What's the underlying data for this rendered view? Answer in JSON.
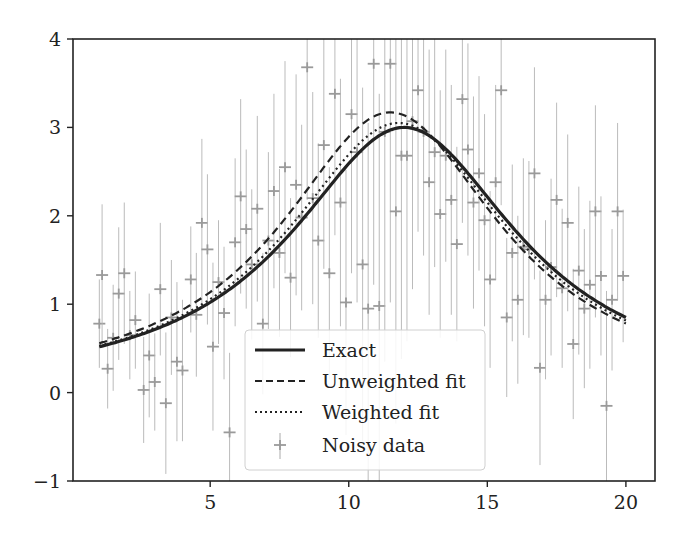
{
  "chart_data": {
    "type": "line",
    "title": "",
    "xlabel": "",
    "ylabel": "",
    "xlim": [
      0.05,
      21.05
    ],
    "ylim": [
      -1,
      4
    ],
    "grid": false,
    "legend_position": "lower center",
    "x_ticks": [
      5,
      10,
      15,
      20
    ],
    "x_tick_labels": [
      "5",
      "10",
      "15",
      "20"
    ],
    "y_ticks": [
      -1,
      0,
      1,
      2,
      3,
      4
    ],
    "y_tick_labels": [
      "−1",
      "0",
      "1",
      "2",
      "3",
      "4"
    ],
    "series": [
      {
        "name": "Exact",
        "style": "solid",
        "color": "#222222",
        "model": {
          "amplitude": 3.0,
          "center": 12.0,
          "width": 5.03
        },
        "x": [
          1,
          2,
          3,
          4,
          5,
          6,
          7,
          8,
          9,
          10,
          11,
          12,
          13,
          14,
          15,
          16,
          17,
          18,
          19,
          20
        ],
        "values": [
          0.52,
          0.62,
          0.74,
          0.9,
          1.1,
          1.38,
          1.73,
          2.13,
          2.56,
          2.88,
          2.99,
          3.0,
          2.88,
          2.59,
          2.23,
          1.84,
          1.5,
          1.24,
          1.02,
          0.85
        ]
      },
      {
        "name": "Unweighted fit",
        "style": "dashed",
        "color": "#222222",
        "model": {
          "amplitude": 3.17,
          "center": 11.5,
          "width": 4.86
        },
        "x": [
          1,
          2,
          3,
          4,
          5,
          6,
          7,
          8,
          9,
          10,
          11,
          12,
          13,
          14,
          15,
          16,
          17,
          18,
          19,
          20
        ],
        "values": [
          0.56,
          0.66,
          0.79,
          0.97,
          1.21,
          1.52,
          1.92,
          2.38,
          2.81,
          3.09,
          3.14,
          3.14,
          2.98,
          2.64,
          2.23,
          1.82,
          1.47,
          1.19,
          0.96,
          0.78
        ]
      },
      {
        "name": "Weighted fit",
        "style": "dotted",
        "color": "#222222",
        "model": {
          "amplitude": 3.05,
          "center": 11.8,
          "width": 4.95
        },
        "x": [
          1,
          2,
          3,
          4,
          5,
          6,
          7,
          8,
          9,
          10,
          11,
          12,
          13,
          14,
          15,
          16,
          17,
          18,
          19,
          20
        ],
        "values": [
          0.53,
          0.63,
          0.76,
          0.93,
          1.15,
          1.44,
          1.81,
          2.24,
          2.65,
          2.95,
          3.03,
          3.04,
          2.91,
          2.6,
          2.22,
          1.84,
          1.49,
          1.21,
          0.99,
          0.81
        ]
      },
      {
        "name": "Noisy data",
        "style": "errorbar-plus",
        "color": "#9a9a9a",
        "x": [
          1.0,
          1.1,
          1.3,
          1.5,
          1.7,
          1.9,
          2.1,
          2.3,
          2.6,
          2.8,
          3.0,
          3.2,
          3.4,
          3.6,
          3.8,
          4.0,
          4.3,
          4.5,
          4.7,
          4.9,
          5.1,
          5.3,
          5.5,
          5.7,
          5.9,
          6.1,
          6.3,
          6.5,
          6.7,
          6.9,
          7.1,
          7.3,
          7.5,
          7.7,
          7.9,
          8.1,
          8.3,
          8.5,
          8.7,
          8.9,
          9.1,
          9.3,
          9.5,
          9.7,
          9.9,
          10.1,
          10.3,
          10.5,
          10.7,
          10.9,
          11.1,
          11.3,
          11.5,
          11.7,
          11.9,
          12.1,
          12.3,
          12.5,
          12.7,
          12.9,
          13.1,
          13.3,
          13.5,
          13.7,
          13.9,
          14.1,
          14.3,
          14.5,
          14.7,
          14.9,
          15.1,
          15.3,
          15.5,
          15.7,
          15.9,
          16.1,
          16.3,
          16.5,
          16.7,
          16.9,
          17.1,
          17.3,
          17.5,
          17.7,
          17.9,
          18.1,
          18.3,
          18.5,
          18.7,
          18.9,
          19.1,
          19.3,
          19.5,
          19.7,
          19.9
        ],
        "values": [
          0.78,
          1.33,
          0.27,
          0.62,
          1.12,
          1.35,
          0.65,
          0.82,
          0.03,
          0.42,
          0.12,
          1.17,
          -0.12,
          0.85,
          0.35,
          0.25,
          1.28,
          0.88,
          1.92,
          1.62,
          0.52,
          1.25,
          0.9,
          -0.45,
          1.7,
          2.22,
          1.85,
          1.45,
          2.08,
          0.78,
          1.72,
          2.28,
          1.58,
          2.55,
          1.3,
          2.35,
          1.98,
          3.68,
          2.2,
          1.72,
          2.8,
          1.35,
          3.38,
          2.15,
          1.02,
          3.15,
          2.72,
          1.45,
          0.95,
          3.72,
          0.98,
          2.95,
          3.72,
          2.05,
          2.68,
          2.68,
          3.07,
          3.42,
          2.95,
          2.38,
          2.72,
          2.02,
          2.68,
          2.18,
          1.68,
          3.32,
          2.75,
          2.15,
          2.48,
          1.95,
          1.28,
          2.38,
          3.42,
          0.85,
          1.58,
          1.05,
          1.65,
          1.62,
          2.48,
          0.28,
          1.05,
          1.42,
          2.18,
          1.18,
          1.92,
          0.55,
          1.38,
          0.95,
          1.22,
          2.05,
          1.32,
          -0.15,
          1.05,
          2.05,
          1.32
        ],
        "errors": [
          0.5,
          0.8,
          0.45,
          0.6,
          0.75,
          0.8,
          0.5,
          0.55,
          0.6,
          0.7,
          0.55,
          0.75,
          0.8,
          0.65,
          0.9,
          0.8,
          0.6,
          0.7,
          0.95,
          0.85,
          0.95,
          0.7,
          0.75,
          0.9,
          0.95,
          1.1,
          0.9,
          0.85,
          1.05,
          0.8,
          1.0,
          1.1,
          0.95,
          1.2,
          0.9,
          1.25,
          1.05,
          1.5,
          1.2,
          1.1,
          1.4,
          1.2,
          1.6,
          1.4,
          1.5,
          1.8,
          1.7,
          2.0,
          2.1,
          2.5,
          2.4,
          2.6,
          2.7,
          2.4,
          2.3,
          2.1,
          1.9,
          1.6,
          1.4,
          1.5,
          1.3,
          1.4,
          1.2,
          1.3,
          1.1,
          1.4,
          1.2,
          1.2,
          1.1,
          1.2,
          1.0,
          1.1,
          1.3,
          0.9,
          1.0,
          0.95,
          1.0,
          1.0,
          1.2,
          1.1,
          0.9,
          1.0,
          1.1,
          0.9,
          1.0,
          0.85,
          0.95,
          0.9,
          0.95,
          1.2,
          0.9,
          1.3,
          0.8,
          1.0,
          0.75
        ]
      }
    ]
  },
  "legend": {
    "items": [
      {
        "label": "Exact",
        "style": "solid"
      },
      {
        "label": "Unweighted fit",
        "style": "dashed"
      },
      {
        "label": "Weighted fit",
        "style": "dotted"
      },
      {
        "label": "Noisy data",
        "style": "errorbar-plus"
      }
    ]
  },
  "plot_area": {
    "left": 73,
    "right": 655,
    "top": 39,
    "bottom": 481
  }
}
